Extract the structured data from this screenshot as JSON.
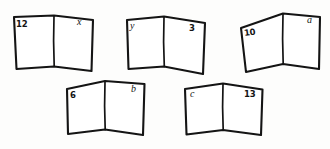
{
  "figure": {
    "type": "hand-drawn-diagram",
    "background_color": "#fdfdfc",
    "ink_color": "#141414"
  },
  "books": [
    {
      "id": "book-1",
      "left_label": "12",
      "left_kind": "number",
      "right_label": "x",
      "right_kind": "variable"
    },
    {
      "id": "book-2",
      "left_label": "y",
      "left_kind": "variable",
      "right_label": "3",
      "right_kind": "number"
    },
    {
      "id": "book-3",
      "left_label": "10",
      "left_kind": "number",
      "right_label": "a",
      "right_kind": "variable"
    },
    {
      "id": "book-4",
      "left_label": "6",
      "left_kind": "number",
      "right_label": "b",
      "right_kind": "variable"
    },
    {
      "id": "book-5",
      "left_label": "c",
      "left_kind": "variable",
      "right_label": "13",
      "right_kind": "number"
    }
  ]
}
